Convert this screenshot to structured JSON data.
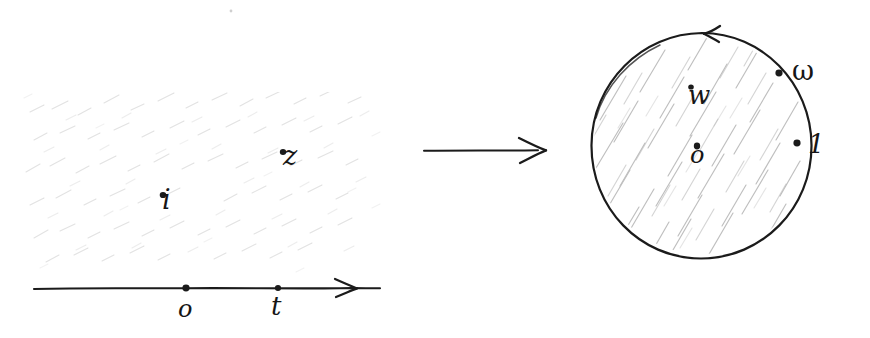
{
  "figure": {
    "width": 870,
    "height": 338,
    "background_color": "#ffffff",
    "ink_color": "#1b1b1b",
    "hatch_color_disk": "#b9b9b9",
    "hatch_color_plane": "#dedede",
    "style": "hand-drawn pencil sketch, scanned"
  },
  "left_panel": {
    "name": "upper-half-plane",
    "region_label": "shaded upper half plane",
    "axis": {
      "orientation": "horizontal",
      "arrow_direction": "right",
      "x_start": 34,
      "x_end": 380,
      "y": 288
    },
    "axis_points": [
      {
        "label": "o",
        "x": 186,
        "y": 288
      },
      {
        "label": "t",
        "x": 278,
        "y": 288
      }
    ],
    "interior_points": [
      {
        "label": "i",
        "x": 163,
        "y": 195
      },
      {
        "label": "z",
        "x": 283,
        "y": 152
      }
    ]
  },
  "map_arrow": {
    "name": "maps-to-arrow",
    "direction": "right",
    "x_start": 424,
    "x_end": 545,
    "y": 150
  },
  "right_panel": {
    "name": "unit-disk",
    "region_label": "shaded unit disk",
    "circle": {
      "center_x": 702,
      "center_y": 146,
      "radius": 110,
      "orientation_arrow": "counterclockwise",
      "arrow_x": 707,
      "arrow_y": 33
    },
    "interior_points": [
      {
        "label": "w",
        "x": 691,
        "y": 92
      },
      {
        "label": "o",
        "x": 697,
        "y": 152
      }
    ],
    "boundary_points": [
      {
        "label": "ω",
        "x": 779,
        "y": 73
      },
      {
        "label": "1",
        "x": 797,
        "y": 143
      }
    ]
  }
}
